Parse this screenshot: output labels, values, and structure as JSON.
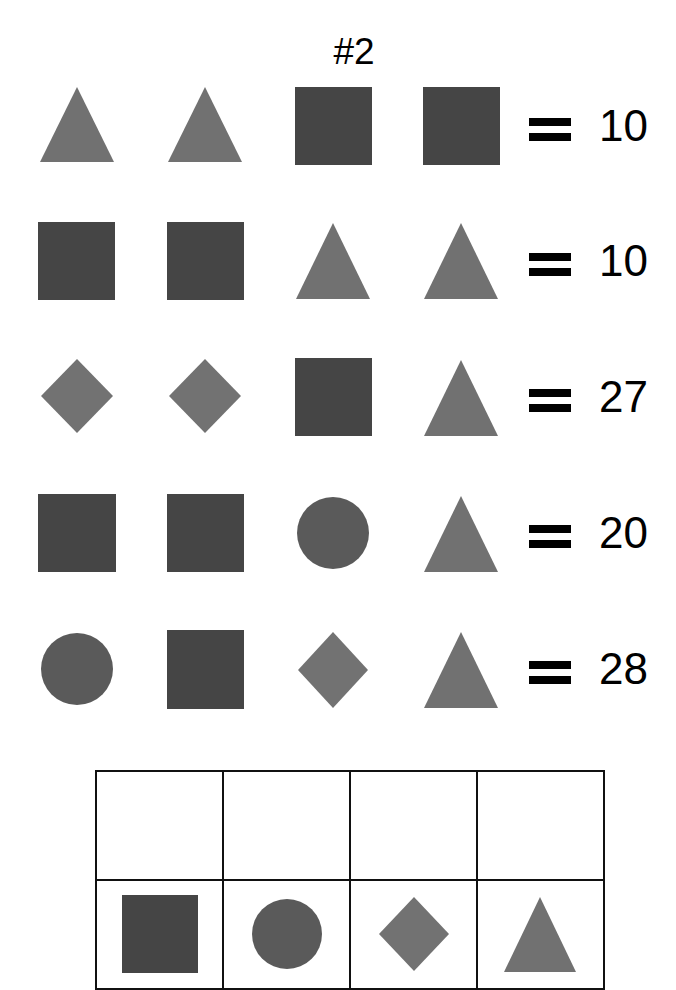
{
  "title": "#2",
  "colors": {
    "square": "#454545",
    "circle": "#5a5a5a",
    "triangle": "#717171",
    "diamond": "#727272",
    "text": "#000000",
    "grid_line": "#111111"
  },
  "equations": [
    {
      "shapes": [
        "triangle",
        "triangle",
        "square",
        "square"
      ],
      "operator": "=",
      "result": "10"
    },
    {
      "shapes": [
        "square",
        "square",
        "triangle",
        "triangle"
      ],
      "operator": "=",
      "result": "10"
    },
    {
      "shapes": [
        "diamond",
        "diamond",
        "square",
        "triangle"
      ],
      "operator": "=",
      "result": "27"
    },
    {
      "shapes": [
        "square",
        "square",
        "circle",
        "triangle"
      ],
      "operator": "=",
      "result": "20"
    },
    {
      "shapes": [
        "circle",
        "square",
        "diamond",
        "triangle"
      ],
      "operator": "=",
      "result": "28"
    }
  ],
  "answer_grid": {
    "answers": [
      "",
      "",
      "",
      ""
    ],
    "key_shapes": [
      "square",
      "circle",
      "diamond",
      "triangle"
    ]
  }
}
